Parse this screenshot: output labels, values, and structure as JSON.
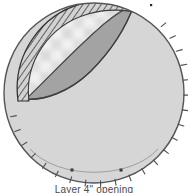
{
  "figure": {
    "caption": "Layer 4\" opening",
    "canvas": {
      "width": 188,
      "height": 193
    },
    "colors": {
      "background": "#ffffff",
      "body_fill": "#d6d6d6",
      "body_stroke": "#555555",
      "flap_underside_fill": "#a3a3a3",
      "flap_stroke": "#4a4a4a",
      "band_fill": "#cfcfcf",
      "band_stroke": "#3d3d3d",
      "hatch_stroke": "#3a3a3a",
      "aperture_light": "#f2f2f2",
      "aperture_check_a": "#ededed",
      "aperture_check_b": "#c9c9c9",
      "tick_stroke": "#4f4f4f",
      "marker_fill": "#2b2b2b",
      "caption_text": "#4a4a4a"
    },
    "geometry": {
      "circle": {
        "cx": 94,
        "cy": 93,
        "r": 90
      },
      "aperture_label": "peeled-back opening",
      "band_label": "hatched rim band",
      "flap_label": "folded flap underside"
    },
    "perimeter_ticks": {
      "label": "radial scale ticks",
      "count": 22,
      "start_angle_deg": -76,
      "end_angle_deg": 250,
      "length": 6
    },
    "markers": {
      "label": "reference point markers",
      "points": [
        {
          "x": 72,
          "y": 170,
          "size": 3
        },
        {
          "x": 121,
          "y": 170,
          "size": 3
        },
        {
          "x": 151,
          "y": 5,
          "size": 2
        }
      ]
    },
    "checker": {
      "label": "blurred checkered background",
      "cell": 11,
      "origin_x": 18,
      "origin_y": 6,
      "cols": 7,
      "rows": 7
    }
  }
}
